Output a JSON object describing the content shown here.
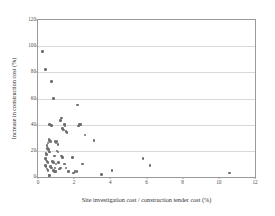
{
  "chart_data": {
    "type": "scatter",
    "title": "",
    "xlabel": "Site investigation cost / construction tender cost (%)",
    "ylabel": "Increase in construction cost (%)",
    "xlim": [
      0,
      12
    ],
    "ylim": [
      0,
      120
    ],
    "xticks": [
      0,
      2,
      4,
      6,
      8,
      10,
      12
    ],
    "yticks": [
      0,
      20,
      40,
      60,
      80,
      100,
      120
    ],
    "grid": "horizontal",
    "legend": "none",
    "marker_color": "#6e6e6e",
    "frame_color": "#9a9a9a",
    "gridline_color": "#d9d9d9",
    "points": [
      [
        0.25,
        96
      ],
      [
        0.4,
        82
      ],
      [
        0.75,
        73
      ],
      [
        0.85,
        60
      ],
      [
        2.2,
        55
      ],
      [
        1.3,
        45
      ],
      [
        1.25,
        43
      ],
      [
        0.65,
        40
      ],
      [
        0.75,
        39.5
      ],
      [
        1.45,
        40
      ],
      [
        1.5,
        39
      ],
      [
        2.3,
        40
      ],
      [
        2.35,
        40
      ],
      [
        2.25,
        39
      ],
      [
        1.35,
        37
      ],
      [
        1.4,
        36
      ],
      [
        1.55,
        35
      ],
      [
        1.6,
        34
      ],
      [
        2.6,
        32
      ],
      [
        3.1,
        28
      ],
      [
        0.6,
        29
      ],
      [
        0.65,
        28
      ],
      [
        0.7,
        27
      ],
      [
        0.95,
        27
      ],
      [
        1.0,
        26
      ],
      [
        1.05,
        27
      ],
      [
        1.1,
        25
      ],
      [
        0.55,
        26
      ],
      [
        0.5,
        24
      ],
      [
        0.52,
        22
      ],
      [
        0.58,
        21
      ],
      [
        0.6,
        20
      ],
      [
        0.62,
        19
      ],
      [
        1.05,
        20
      ],
      [
        1.1,
        19
      ],
      [
        0.45,
        18
      ],
      [
        0.48,
        17
      ],
      [
        0.9,
        16
      ],
      [
        1.3,
        16
      ],
      [
        1.35,
        15
      ],
      [
        1.9,
        15
      ],
      [
        0.42,
        14
      ],
      [
        0.45,
        13
      ],
      [
        0.5,
        12
      ],
      [
        0.55,
        11
      ],
      [
        0.8,
        12
      ],
      [
        0.85,
        11
      ],
      [
        1.0,
        10
      ],
      [
        1.15,
        11
      ],
      [
        1.45,
        10
      ],
      [
        2.45,
        10
      ],
      [
        5.8,
        14
      ],
      [
        6.2,
        9
      ],
      [
        0.4,
        9
      ],
      [
        0.45,
        8
      ],
      [
        0.7,
        8
      ],
      [
        0.75,
        7
      ],
      [
        0.95,
        7
      ],
      [
        1.2,
        6
      ],
      [
        1.25,
        7
      ],
      [
        1.55,
        7
      ],
      [
        0.5,
        6
      ],
      [
        0.55,
        5
      ],
      [
        0.85,
        5
      ],
      [
        0.9,
        4
      ],
      [
        1.0,
        4
      ],
      [
        1.7,
        4
      ],
      [
        1.95,
        3
      ],
      [
        2.05,
        4
      ],
      [
        2.15,
        4
      ],
      [
        3.5,
        2
      ],
      [
        4.1,
        5
      ],
      [
        0.6,
        1
      ],
      [
        0.65,
        1
      ],
      [
        10.6,
        3
      ]
    ]
  }
}
